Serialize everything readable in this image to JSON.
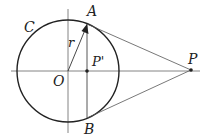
{
  "diagram": {
    "type": "geometry",
    "labels": {
      "circle": "C",
      "center": "O",
      "radius": "r",
      "point_a": "A",
      "point_b": "B",
      "point_p": "P",
      "point_p_prime": "P'"
    },
    "colors": {
      "stroke": "#222222",
      "thin_line": "#555555",
      "background": "#ffffff"
    }
  }
}
